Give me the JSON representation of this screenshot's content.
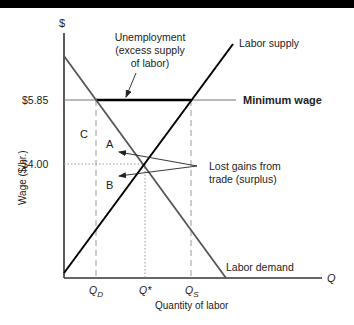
{
  "figure": {
    "y_axis_symbol": "$",
    "x_axis_symbol": "Q",
    "y_axis_label": "Wage ($/hr.)",
    "x_axis_label": "Quantity of labor",
    "y_ticks": [
      {
        "label": "$5.85",
        "value": 5.85
      },
      {
        "label": "$4.00",
        "value": 4.0
      }
    ],
    "x_ticks": [
      {
        "label": "Q",
        "sub": "D"
      },
      {
        "label": "Q*",
        "sub": ""
      },
      {
        "label": "Q",
        "sub": "S"
      }
    ],
    "curves": {
      "supply": "Labor supply",
      "demand": "Labor demand",
      "min_wage": "Minimum wage"
    },
    "annotations": {
      "unemployment": [
        "Unemployment",
        "(excess supply",
        "of labor)"
      ],
      "lost_gains": [
        "Lost gains from",
        "trade (surplus)"
      ],
      "region_a": "A",
      "region_b": "B",
      "region_c": "C"
    }
  },
  "colors": {
    "supply": "#000000",
    "demand": "#444444",
    "min_wage_thin": "#666666",
    "min_wage_bold": "#000000",
    "guides": "#888888"
  }
}
